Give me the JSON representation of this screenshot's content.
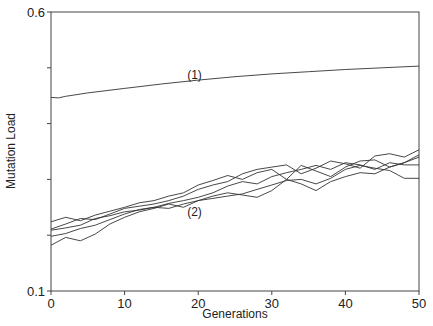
{
  "chart_data": {
    "type": "line",
    "title": "",
    "xlabel": "Generations",
    "ylabel": "Mutation Load",
    "xlim": [
      0,
      50
    ],
    "ylim": [
      0.1,
      0.6
    ],
    "x_ticks": [
      0,
      10,
      20,
      30,
      40,
      50
    ],
    "x_tick_labels": [
      "0",
      "10",
      "20",
      "30",
      "40",
      "50"
    ],
    "y_ticks": [
      0.1,
      0.2,
      0.3,
      0.4,
      0.5,
      0.6
    ],
    "y_tick_labels": [
      "0.1",
      "",
      "",
      "",
      "",
      "0.6"
    ],
    "grid": false,
    "legend": "none",
    "annotations": [
      {
        "text": "(1)",
        "x": 19.5,
        "y": 0.48
      },
      {
        "text": "(2)",
        "x": 19.5,
        "y": 0.235
      }
    ],
    "series": [
      {
        "name": "(1)",
        "x": [
          0,
          1,
          2,
          5,
          10,
          15,
          20,
          25,
          30,
          35,
          40,
          45,
          50
        ],
        "values": [
          0.447,
          0.446,
          0.449,
          0.455,
          0.463,
          0.471,
          0.478,
          0.484,
          0.489,
          0.493,
          0.497,
          0.5,
          0.503
        ]
      },
      {
        "name": "(2) replicate A",
        "x": [
          0,
          2,
          4,
          6,
          8,
          10,
          12,
          14,
          16,
          18,
          20,
          22,
          24,
          26,
          28,
          30,
          32,
          34,
          36,
          38,
          40,
          42,
          44,
          46,
          48,
          50
        ],
        "values": [
          0.224,
          0.232,
          0.226,
          0.236,
          0.243,
          0.25,
          0.258,
          0.262,
          0.27,
          0.276,
          0.29,
          0.298,
          0.307,
          0.3,
          0.312,
          0.318,
          0.3,
          0.325,
          0.315,
          0.305,
          0.322,
          0.333,
          0.335,
          0.322,
          0.33,
          0.344
        ]
      },
      {
        "name": "(2) replicate B",
        "x": [
          0,
          2,
          4,
          6,
          8,
          10,
          12,
          14,
          16,
          18,
          20,
          22,
          24,
          26,
          28,
          30,
          32,
          34,
          36,
          38,
          40,
          42,
          44,
          46,
          48,
          50
        ],
        "values": [
          0.211,
          0.22,
          0.23,
          0.228,
          0.238,
          0.248,
          0.252,
          0.256,
          0.262,
          0.27,
          0.282,
          0.29,
          0.296,
          0.31,
          0.318,
          0.322,
          0.326,
          0.31,
          0.32,
          0.333,
          0.328,
          0.32,
          0.342,
          0.346,
          0.34,
          0.353
        ]
      },
      {
        "name": "(2) replicate C",
        "x": [
          0,
          2,
          4,
          6,
          8,
          10,
          12,
          14,
          16,
          18,
          20,
          22,
          24,
          26,
          28,
          30,
          32,
          34,
          36,
          38,
          40,
          42,
          44,
          46,
          48,
          50
        ],
        "values": [
          0.209,
          0.213,
          0.218,
          0.23,
          0.235,
          0.242,
          0.245,
          0.25,
          0.257,
          0.262,
          0.268,
          0.276,
          0.288,
          0.296,
          0.292,
          0.305,
          0.312,
          0.318,
          0.325,
          0.318,
          0.33,
          0.326,
          0.318,
          0.33,
          0.326,
          0.326
        ]
      },
      {
        "name": "(2) replicate D",
        "x": [
          0,
          2,
          4,
          6,
          8,
          10,
          12,
          14,
          16,
          18,
          20,
          22,
          24,
          26,
          28,
          30,
          32,
          34,
          36,
          38,
          40,
          42,
          44,
          46,
          48,
          50
        ],
        "values": [
          0.198,
          0.203,
          0.212,
          0.218,
          0.228,
          0.238,
          0.246,
          0.25,
          0.248,
          0.256,
          0.262,
          0.266,
          0.27,
          0.274,
          0.282,
          0.29,
          0.298,
          0.3,
          0.292,
          0.302,
          0.318,
          0.325,
          0.32,
          0.316,
          0.302,
          0.302
        ]
      },
      {
        "name": "(2) replicate E",
        "x": [
          0,
          2,
          4,
          6,
          8,
          10,
          12,
          14,
          16,
          18,
          20,
          22,
          24,
          26,
          28,
          30,
          32,
          34,
          36,
          38,
          40,
          42,
          44,
          46,
          48,
          50
        ],
        "values": [
          0.182,
          0.196,
          0.19,
          0.202,
          0.22,
          0.232,
          0.242,
          0.248,
          0.256,
          0.25,
          0.262,
          0.27,
          0.276,
          0.272,
          0.268,
          0.28,
          0.3,
          0.292,
          0.28,
          0.296,
          0.305,
          0.312,
          0.31,
          0.322,
          0.33,
          0.34
        ]
      }
    ]
  }
}
